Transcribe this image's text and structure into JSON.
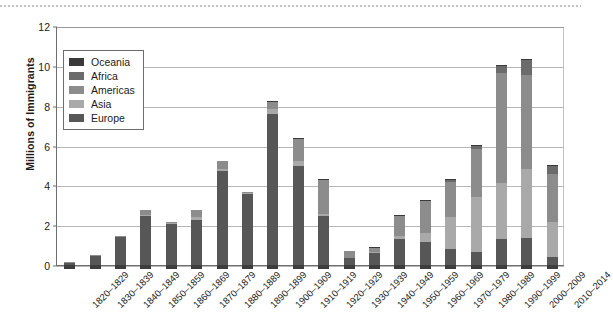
{
  "chart_data": {
    "type": "bar",
    "subtype": "stacked-bar",
    "title": "",
    "xlabel": "",
    "ylabel": "Millions of Immigrants",
    "ylim": [
      0,
      12
    ],
    "ytick_values": [
      0,
      2,
      4,
      6,
      8,
      10,
      12
    ],
    "ytick_labels": [
      "0",
      "2",
      "4",
      "6",
      "8",
      "10",
      "12"
    ],
    "grid": "horizontal",
    "legend_position": "upper-left-inside",
    "categories": [
      "1820–1829",
      "1830–1839",
      "1840–1849",
      "1850–1859",
      "1860–1869",
      "1870–1879",
      "1880–1889",
      "1890–1899",
      "1900–1909",
      "1910–1919",
      "1920–1929",
      "1930–1939",
      "1940–1949",
      "1950–1959",
      "1960–1969",
      "1970–1979",
      "1980–1989",
      "1990–1999",
      "2000–2009",
      "2010–2014"
    ],
    "stack_order_bottom_to_top": [
      "Europe",
      "Asia",
      "Americas",
      "Africa",
      "Oceania"
    ],
    "series": [
      {
        "name": "Europe",
        "color": "#575757",
        "values": [
          0.1,
          0.48,
          1.41,
          2.45,
          2.06,
          2.27,
          4.74,
          3.56,
          7.57,
          4.99,
          2.48,
          0.35,
          0.62,
          1.33,
          1.17,
          0.8,
          0.67,
          1.31,
          1.35,
          0.4
        ]
      },
      {
        "name": "Asia",
        "color": "#a9a9a9",
        "values": [
          0.0,
          0.0,
          0.0,
          0.04,
          0.06,
          0.13,
          0.07,
          0.06,
          0.26,
          0.22,
          0.1,
          0.02,
          0.03,
          0.15,
          0.43,
          1.59,
          2.74,
          2.82,
          3.47,
          1.78
        ]
      },
      {
        "name": "Americas",
        "color": "#8c8c8c",
        "values": [
          0.01,
          0.02,
          0.03,
          0.29,
          0.03,
          0.38,
          0.43,
          0.04,
          0.36,
          1.14,
          1.7,
          0.35,
          0.2,
          1.0,
          1.6,
          1.8,
          2.4,
          5.5,
          4.7,
          2.4
        ]
      },
      {
        "name": "Africa",
        "color": "#6b6b6b",
        "values": [
          0.0,
          0.0,
          0.0,
          0.0,
          0.0,
          0.0,
          0.0,
          0.0,
          0.01,
          0.01,
          0.01,
          0.0,
          0.0,
          0.01,
          0.03,
          0.08,
          0.18,
          0.35,
          0.76,
          0.42
        ]
      },
      {
        "name": "Oceania",
        "color": "#3a3a3a",
        "values": [
          0.0,
          0.0,
          0.0,
          0.0,
          0.0,
          0.0,
          0.0,
          0.0,
          0.01,
          0.01,
          0.01,
          0.0,
          0.01,
          0.01,
          0.02,
          0.03,
          0.04,
          0.06,
          0.07,
          0.04
        ]
      }
    ],
    "totals": [
      0.11,
      0.5,
      1.44,
      2.78,
      2.15,
      2.78,
      5.24,
      3.66,
      8.21,
      6.37,
      4.3,
      0.72,
      0.86,
      2.5,
      3.25,
      4.3,
      6.03,
      10.04,
      10.35,
      5.04
    ]
  },
  "legend": {
    "items": [
      {
        "label": "Oceania",
        "color": "#3a3a3a"
      },
      {
        "label": "Africa",
        "color": "#6b6b6b"
      },
      {
        "label": "Americas",
        "color": "#8c8c8c"
      },
      {
        "label": "Asia",
        "color": "#a9a9a9"
      },
      {
        "label": "Europe",
        "color": "#575757"
      }
    ]
  },
  "axes": {
    "y_title": "Millions of Immigrants"
  }
}
